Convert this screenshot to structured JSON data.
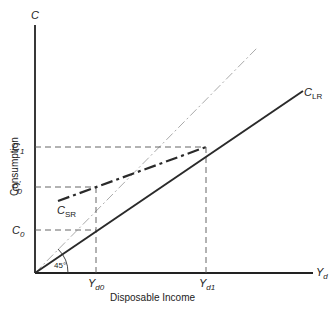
{
  "axes": {
    "y_axis_label": "C",
    "y_axis_title": "Consumption",
    "x_axis_label": "Y",
    "x_axis_label_sub": "d",
    "x_axis_title": "Disposable Income"
  },
  "y_ticks": [
    {
      "main": "C",
      "sub": "1",
      "prime": ""
    },
    {
      "main": "C",
      "sub": "0",
      "prime": "′"
    },
    {
      "main": "C",
      "sub": "0",
      "prime": ""
    }
  ],
  "x_ticks": [
    {
      "main": "Y",
      "sub": "d0"
    },
    {
      "main": "Y",
      "sub": "d1"
    }
  ],
  "curves": {
    "long_run": {
      "main": "C",
      "sub": "LR"
    },
    "short_run": {
      "main": "C",
      "sub": "SR"
    },
    "reference": "45°"
  },
  "colors": {
    "axis": "#222222",
    "clr": "#2a2a2a",
    "csr": "#2a2a2a",
    "ref45": "#aaaaaa",
    "guide": "#666666"
  }
}
